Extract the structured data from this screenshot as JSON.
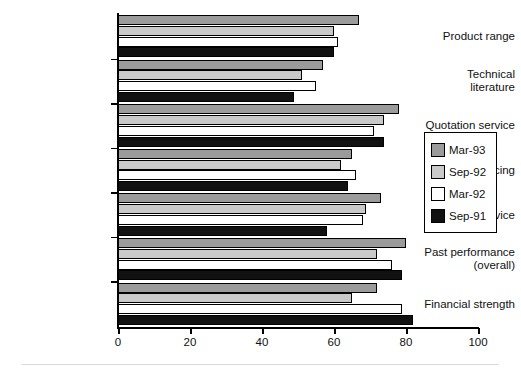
{
  "chart_data": {
    "type": "bar",
    "orientation": "horizontal",
    "title": "",
    "subtitle": "",
    "xlabel": "",
    "ylabel": "",
    "xlim": [
      0,
      100
    ],
    "xticks": [
      0,
      20,
      40,
      60,
      80,
      100
    ],
    "xticklabels": [
      "0",
      "20",
      "40",
      "60",
      "80",
      "100"
    ],
    "grid": false,
    "legend_position": "right-middle",
    "categories": [
      "Product range",
      "Technical\nliterature",
      "Quotation service",
      "Pricing",
      "Overall service",
      "Past performance\n(overall)",
      "Financial strength"
    ],
    "series": [
      {
        "name": "Mar-93",
        "color": "#9b9b9b",
        "values": [
          67,
          57,
          78,
          65,
          73,
          80,
          72
        ]
      },
      {
        "name": "Sep-92",
        "color": "#c9c9c9",
        "values": [
          60,
          51,
          74,
          62,
          69,
          72,
          65
        ]
      },
      {
        "name": "Mar-92",
        "color": "#ffffff",
        "values": [
          61,
          55,
          71,
          66,
          68,
          76,
          79
        ]
      },
      {
        "name": "Sep-91",
        "color": "#111111",
        "values": [
          60,
          49,
          74,
          64,
          58,
          79,
          82
        ]
      }
    ]
  },
  "legend": {
    "entries": [
      {
        "label": "Mar-93"
      },
      {
        "label": "Sep-92"
      },
      {
        "label": "Mar-92"
      },
      {
        "label": "Sep-91"
      }
    ]
  },
  "axis": {
    "x_tick_labels": [
      "0",
      "20",
      "40",
      "60",
      "80",
      "100"
    ]
  }
}
